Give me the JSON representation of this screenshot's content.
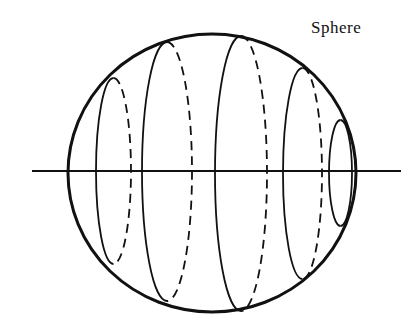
{
  "title": "Sphere",
  "colors": {
    "stroke": "#111111",
    "background": "#ffffff"
  },
  "diagram": {
    "outline": {
      "cx": 212,
      "cy": 173,
      "rx": 144,
      "ry": 139
    },
    "axis": {
      "x1": 32,
      "x2": 401,
      "y": 171
    },
    "slices": [
      {
        "x_solid": 96,
        "x_dashed": 131,
        "top": 78,
        "bottom": 264
      },
      {
        "x_solid": 142,
        "x_dashed": 192,
        "top": 42,
        "bottom": 301
      },
      {
        "x_solid": 215,
        "x_dashed": 267,
        "top": 36,
        "bottom": 311
      },
      {
        "x_solid": 283,
        "x_dashed": 322,
        "top": 68,
        "bottom": 279
      },
      {
        "x_solid": 329,
        "x_dashed": 352,
        "top": 120,
        "bottom": 226
      }
    ]
  }
}
